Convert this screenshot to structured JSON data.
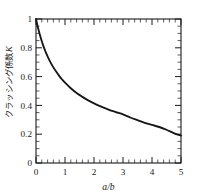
{
  "chart_data": {
    "type": "line",
    "title": "",
    "subtitle": "",
    "xlabel": "a/b",
    "ylabel": "クラッシング係数 K",
    "ylabel_jp": "クラッシング係数",
    "ylabel_symbol": "K",
    "xlim": [
      0,
      5
    ],
    "ylim": [
      0,
      1
    ],
    "grid": false,
    "legend": null,
    "legend_position": "none",
    "x_ticks": [
      0,
      1,
      2,
      3,
      4,
      5
    ],
    "x_tick_labels": [
      "0",
      "1",
      "2",
      "3",
      "4",
      "5"
    ],
    "x_minor_ticks_per_interval": 5,
    "y_ticks": [
      0,
      0.2,
      0.4,
      0.6,
      0.8,
      1
    ],
    "y_tick_labels": [
      "0",
      "0.2",
      "0.4",
      "0.6",
      "0.8",
      "1"
    ],
    "y_minor_ticks_per_interval": 4,
    "tick_direction": "in",
    "frame": "box",
    "series": [
      {
        "name": "K",
        "color": "#161616",
        "x": [
          0.0,
          0.05,
          0.1,
          0.15,
          0.2,
          0.25,
          0.3,
          0.35,
          0.4,
          0.5,
          0.6,
          0.7,
          0.8,
          0.9,
          1.0,
          1.2,
          1.4,
          1.6,
          1.8,
          2.0,
          2.25,
          2.5,
          2.75,
          3.0,
          3.25,
          3.5,
          3.75,
          4.0,
          4.25,
          4.5,
          4.75,
          5.0
        ],
        "y": [
          1.0,
          0.955,
          0.915,
          0.878,
          0.845,
          0.815,
          0.788,
          0.763,
          0.74,
          0.699,
          0.664,
          0.633,
          0.605,
          0.58,
          0.558,
          0.519,
          0.486,
          0.459,
          0.435,
          0.414,
          0.391,
          0.371,
          0.354,
          0.338,
          0.316,
          0.297,
          0.279,
          0.264,
          0.25,
          0.231,
          0.208,
          0.19
        ]
      }
    ]
  },
  "axis_labels": {
    "x_title": "a/b",
    "y_title_jp": "クラッシング係数",
    "y_title_symbol": "K"
  },
  "colors": {
    "curve": "#161616",
    "axis": "#1a1a1a",
    "background": "#ffffff"
  }
}
